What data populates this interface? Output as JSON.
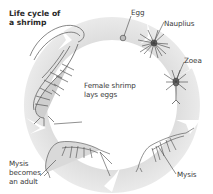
{
  "diagram": {
    "title_lines": [
      "Life cycle of",
      "a shrimp"
    ],
    "ring": {
      "center": [
        112,
        105
      ],
      "outer_radius": 88,
      "inner_radius": 65,
      "fill_color": "#e3e3e3",
      "separator_color": "#ffffff",
      "direction": "clockwise"
    },
    "stages": [
      {
        "id": "egg",
        "label": "Egg",
        "order": 1
      },
      {
        "id": "nauplius",
        "label": "Nauplius",
        "order": 2
      },
      {
        "id": "zoea",
        "label": "Zoea",
        "order": 3
      },
      {
        "id": "mysis",
        "label": "Mysis",
        "order": 4
      },
      {
        "id": "mysis-adult",
        "label_lines": [
          "Mysis",
          "becomes",
          "an adult"
        ],
        "order": 5
      },
      {
        "id": "female-lays-eggs",
        "label_lines": [
          "Female shrimp",
          "lays eggs"
        ],
        "order": 6
      }
    ],
    "colors": {
      "text": "#3a3a3a",
      "drawing": "#5a5a5a",
      "leader_line": "#444444"
    }
  }
}
